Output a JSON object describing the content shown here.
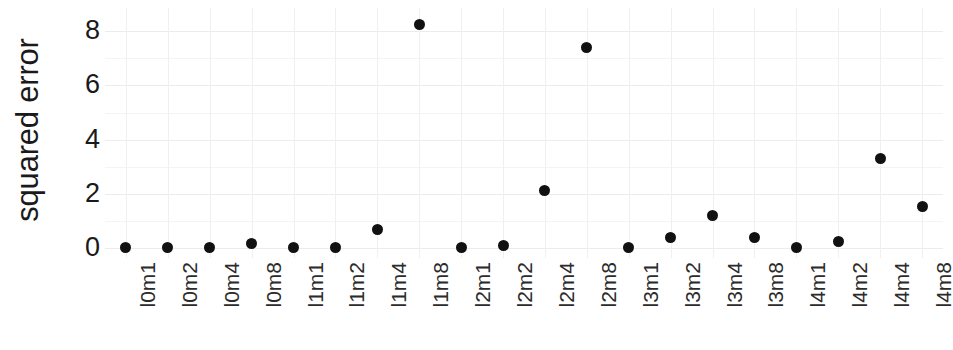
{
  "chart_data": {
    "type": "scatter",
    "title": "",
    "xlabel": "",
    "ylabel": "squared error",
    "categories": [
      "l0m1",
      "l0m2",
      "l0m4",
      "l0m8",
      "l1m1",
      "l1m2",
      "l1m4",
      "l1m8",
      "l2m1",
      "l2m2",
      "l2m4",
      "l2m8",
      "l3m1",
      "l3m2",
      "l3m4",
      "l3m8",
      "l4m1",
      "l4m2",
      "l4m4",
      "l4m8"
    ],
    "values": [
      0.02,
      0.02,
      0.03,
      0.18,
      0.02,
      0.03,
      0.7,
      8.25,
      0.02,
      0.1,
      2.15,
      7.4,
      0.02,
      0.42,
      1.2,
      0.4,
      0.02,
      0.25,
      3.3,
      1.55
    ],
    "ytick_labels": [
      "0",
      "2",
      "4",
      "6",
      "8"
    ],
    "ytick_values": [
      0,
      2,
      4,
      6,
      8
    ],
    "ylim": [
      -0.35,
      8.85
    ],
    "grid": true,
    "legend": "none",
    "marker": "filled-circle",
    "marker_color": "#111111",
    "grid_color": "#ececec",
    "background_color": "#ffffff"
  }
}
